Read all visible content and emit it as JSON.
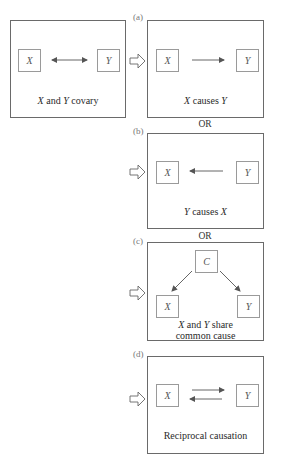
{
  "source": {
    "nodes": {
      "x": "X",
      "y": "Y"
    },
    "caption": {
      "v1": "X",
      "mid": " and ",
      "v2": "Y",
      "tail": " covary"
    }
  },
  "panels": [
    {
      "label": "(a)",
      "nodes": {
        "x": "X",
        "y": "Y"
      },
      "caption": {
        "v1": "X",
        "mid": " causes ",
        "v2": "Y"
      }
    },
    {
      "label": "(b)",
      "nodes": {
        "x": "X",
        "y": "Y"
      },
      "caption": {
        "v1": "Y",
        "mid": " causes ",
        "v2": "X"
      }
    },
    {
      "label": "(c)",
      "nodes": {
        "c": "C",
        "x": "X",
        "y": "Y"
      },
      "caption": {
        "v1": "X",
        "mid": " and ",
        "v2": "Y",
        "tail": " share",
        "line2": "common cause"
      }
    },
    {
      "label": "(d)",
      "nodes": {
        "x": "X",
        "y": "Y"
      },
      "caption": {
        "text": "Reciprocal causation"
      }
    }
  ],
  "separators": [
    "OR",
    "OR"
  ],
  "colors": {
    "border": "#6a6a6a",
    "node_border": "#9a9a9a",
    "arrow": "#555555"
  }
}
